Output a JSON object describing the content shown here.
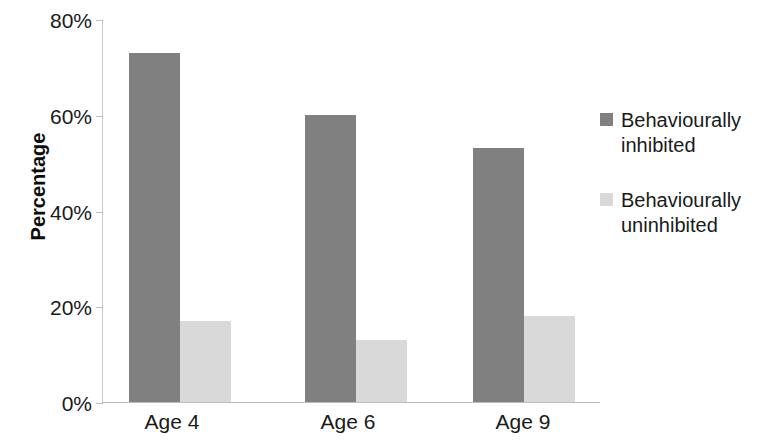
{
  "chart_data": {
    "type": "bar",
    "title": "",
    "subtitle": "",
    "xlabel": "",
    "ylabel": "Percentage",
    "categories": [
      "Age 4",
      "Age 6",
      "Age 9"
    ],
    "series": [
      {
        "name": "Behaviourally inhibited",
        "color": "#808080",
        "values": [
          73,
          60,
          53
        ]
      },
      {
        "name": "Behaviourally uninhibited",
        "color": "#d9d9d9",
        "values": [
          17,
          13,
          18
        ]
      }
    ],
    "ylim": [
      0,
      80
    ],
    "y_ticks": [
      0,
      20,
      40,
      60,
      80
    ],
    "y_tick_labels": [
      "0%",
      "20%",
      "40%",
      "60%",
      "80%"
    ],
    "grid": false,
    "legend_position": "right",
    "value_format": "percent"
  },
  "legend": {
    "items": [
      {
        "label_line1": "Behaviourally",
        "label_line2": "inhibited",
        "color": "#808080"
      },
      {
        "label_line1": "Behaviourally",
        "label_line2": "uninhibited",
        "color": "#d9d9d9"
      }
    ]
  }
}
